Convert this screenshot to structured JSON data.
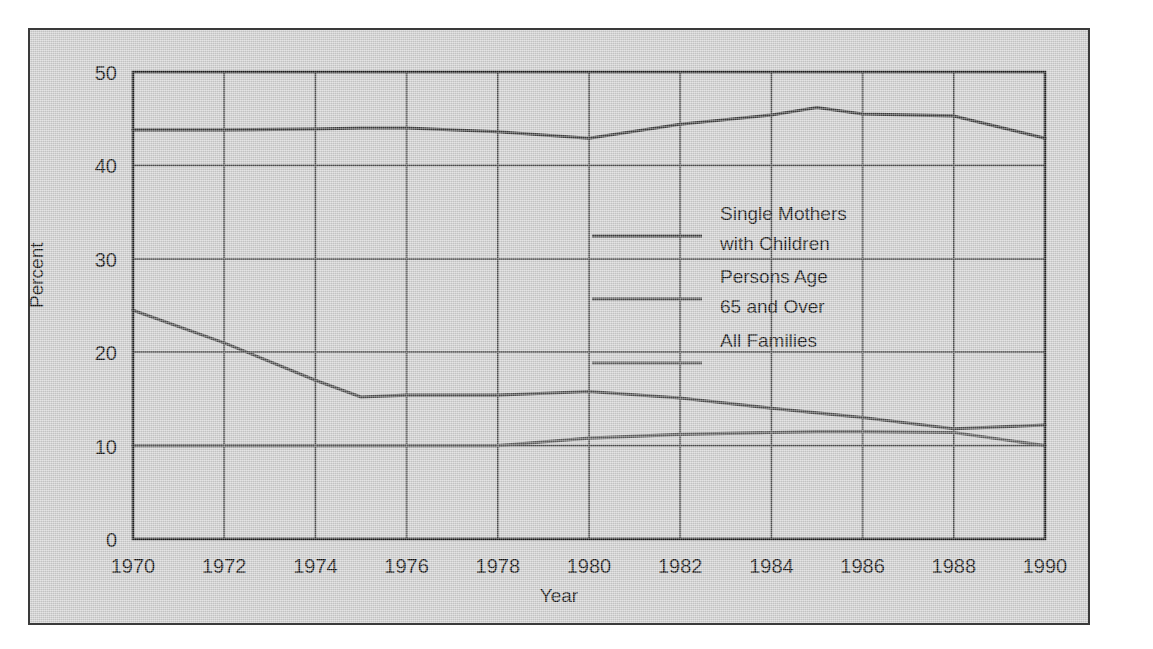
{
  "chart_data": {
    "type": "line",
    "title": "",
    "xlabel": "Year",
    "ylabel": "Percent",
    "xlim": [
      1970,
      1990
    ],
    "ylim": [
      0,
      50
    ],
    "yticks": [
      0,
      10,
      20,
      30,
      40,
      50
    ],
    "xticks": [
      1970,
      1972,
      1974,
      1976,
      1978,
      1980,
      1982,
      1984,
      1986,
      1988,
      1990
    ],
    "grid": true,
    "legend_position": "center",
    "x": [
      1970,
      1972,
      1974,
      1975,
      1976,
      1978,
      1980,
      1982,
      1984,
      1985,
      1986,
      1988,
      1990
    ],
    "series": [
      {
        "name": "Single Mothers with Children",
        "color": "#3b3b3b",
        "values": [
          43.8,
          43.8,
          43.9,
          44.0,
          44.0,
          43.6,
          42.9,
          44.4,
          45.4,
          46.2,
          45.5,
          45.3,
          42.9
        ]
      },
      {
        "name": "Persons Age 65 and Over",
        "color": "#4a4a4a",
        "values": [
          24.5,
          21.0,
          17.0,
          15.2,
          15.4,
          15.4,
          15.8,
          15.1,
          14.0,
          13.5,
          13.0,
          11.8,
          12.2
        ]
      },
      {
        "name": "All Families",
        "color": "#5a5a5a",
        "values": [
          10.0,
          10.0,
          10.0,
          10.0,
          10.0,
          10.0,
          10.8,
          11.2,
          11.4,
          11.5,
          11.5,
          11.4,
          10.0
        ]
      }
    ]
  },
  "legend": {
    "lines": [
      "Single Mothers",
      "with Children",
      "Persons Age",
      "65 and Over",
      "All Families"
    ],
    "entries": [
      {
        "label_line1": "Single Mothers",
        "label_line2": "with Children"
      },
      {
        "label_line1": "Persons Age",
        "label_line2": "65 and Over"
      },
      {
        "label_line1": "All Families",
        "label_line2": ""
      }
    ]
  },
  "axes": {
    "y_title": "Percent",
    "x_title": "Year",
    "y_tick_labels": [
      "50",
      "40",
      "30",
      "20",
      "10",
      "0"
    ],
    "x_tick_labels": [
      "1970",
      "1972",
      "1974",
      "1976",
      "1978",
      "1980",
      "1982",
      "1984",
      "1986",
      "1988",
      "1990"
    ]
  },
  "style": {
    "panel_bg": "#cfcfcf",
    "panel_border": "#3a3a3a",
    "grid_color": "#4d4d4d",
    "axis_color": "#1c1c1c",
    "text_color": "#111111",
    "page_bg": "#ffffff"
  }
}
